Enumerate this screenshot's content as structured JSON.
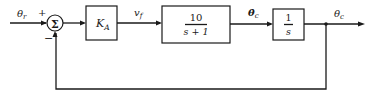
{
  "diagram": {
    "type": "feedback-control-block-diagram",
    "input_signal": {
      "symbol": "θ",
      "subscript": "r"
    },
    "summing_junction": {
      "symbol": "Σ",
      "input_sign": "+",
      "feedback_sign": "−"
    },
    "blocks": [
      {
        "id": "gain",
        "label": "K",
        "subscript": "A"
      },
      {
        "id": "plant",
        "numerator": "10",
        "denominator": "s + 1"
      },
      {
        "id": "integrator",
        "numerator": "1",
        "denominator": "s"
      }
    ],
    "signals": {
      "gain_output": {
        "symbol": "v",
        "subscript": "f"
      },
      "plant_output": {
        "symbol": "θ̇",
        "subscript": "c"
      },
      "output": {
        "symbol": "θ",
        "subscript": "c"
      }
    },
    "feedback": "unity negative feedback from output to summing junction"
  }
}
